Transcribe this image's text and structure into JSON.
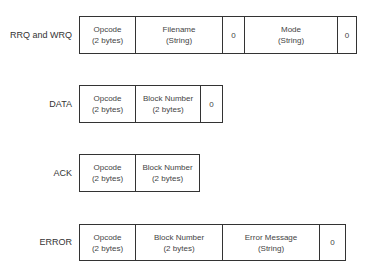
{
  "packets": [
    {
      "name": "RRQ and WRQ",
      "fields": [
        {
          "title": "Opcode",
          "sub": "(2 bytes)"
        },
        {
          "title": "Filename",
          "sub": "(String)"
        },
        {
          "title": "0",
          "sub": ""
        },
        {
          "title": "Mode",
          "sub": "(String)"
        },
        {
          "title": "0",
          "sub": ""
        }
      ]
    },
    {
      "name": "DATA",
      "fields": [
        {
          "title": "Opcode",
          "sub": "(2 bytes)"
        },
        {
          "title": "Block Number",
          "sub": "(2 bytes)"
        },
        {
          "title": "0",
          "sub": ""
        }
      ]
    },
    {
      "name": "ACK",
      "fields": [
        {
          "title": "Opcode",
          "sub": "(2 bytes)"
        },
        {
          "title": "Block Number",
          "sub": "(2 bytes)"
        }
      ]
    },
    {
      "name": "ERROR",
      "fields": [
        {
          "title": "Opcode",
          "sub": "(2 bytes)"
        },
        {
          "title": "Block Number",
          "sub": "(2 bytes)"
        },
        {
          "title": "Error Message",
          "sub": "(String)"
        },
        {
          "title": "0",
          "sub": ""
        }
      ]
    }
  ]
}
